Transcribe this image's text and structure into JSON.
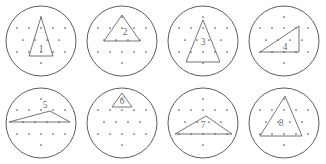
{
  "page": {
    "kind": "worksheet",
    "rows": 2,
    "columns": 4,
    "ink_color": "#5a5a5a",
    "circle_color": "#4a4a4a",
    "background": "#ffffff"
  },
  "grid": {
    "name": "triangular-dot-lattice",
    "dot_color": "#5a5a5a",
    "dot_radius": 0.85,
    "rows": [
      {
        "y": 17,
        "xs": [
          41
        ]
      },
      {
        "y": 28,
        "xs": [
          17,
          29,
          41,
          53,
          65
        ]
      },
      {
        "y": 40,
        "xs": [
          23,
          35,
          47,
          59
        ]
      },
      {
        "y": 52,
        "xs": [
          17,
          29,
          41,
          53,
          65
        ]
      },
      {
        "y": 63,
        "xs": [
          41
        ]
      }
    ]
  },
  "circles": [
    {
      "id": "circle-1",
      "label": "1",
      "label_x": 41,
      "label_y": 52,
      "cx": 41,
      "cy": 41,
      "r": 35,
      "triangle_name": "tall-narrow-isosceles-triangle",
      "points": "41,17 29,56 53,56"
    },
    {
      "id": "circle-2",
      "label": "2",
      "label_x": 44,
      "label_y": 35,
      "cx": 41,
      "cy": 41,
      "r": 35,
      "triangle_name": "equilateral-triangle-upper",
      "points": "41,15 23,41 59,41"
    },
    {
      "id": "circle-3",
      "label": "3",
      "label_x": 41,
      "label_y": 45,
      "cx": 41,
      "cy": 41,
      "r": 35,
      "triangle_name": "tall-isosceles-triangle",
      "points": "41,20 24,62 58,62"
    },
    {
      "id": "circle-4",
      "label": "4",
      "label_x": 42,
      "label_y": 50,
      "cx": 41,
      "cy": 41,
      "r": 35,
      "triangle_name": "right-triangle-vertical-right-leg",
      "points": "56,26 56,52 17,52"
    },
    {
      "id": "circle-5",
      "label": "5",
      "label_x": 45,
      "label_y": 26,
      "cx": 41,
      "cy": 41,
      "r": 35,
      "triangle_name": "very-flat-obtuse-triangle",
      "points": "9,40 50,29 70,40"
    },
    {
      "id": "circle-6",
      "label": "6",
      "label_x": 41,
      "label_y": 22,
      "cx": 41,
      "cy": 41,
      "r": 35,
      "triangle_name": "small-triangle-top",
      "points": "41,11 31,25 51,25"
    },
    {
      "id": "circle-7",
      "label": "7",
      "label_x": 41,
      "label_y": 46,
      "cx": 41,
      "cy": 41,
      "r": 35,
      "triangle_name": "wide-flat-triangle",
      "points": "44,34 13,52 70,52"
    },
    {
      "id": "circle-8",
      "label": "8",
      "label_x": 38,
      "label_y": 44,
      "cx": 41,
      "cy": 41,
      "r": 35,
      "triangle_name": "tall-scalene-triangle",
      "points": "42,14 17,54 59,54"
    }
  ]
}
